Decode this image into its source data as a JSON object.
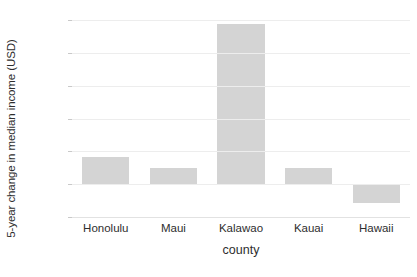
{
  "chart_data": {
    "type": "bar",
    "title": "",
    "subtitle": "",
    "xlabel": "county",
    "ylabel": "5-year change in median income (USD)",
    "categories": [
      "Honolulu",
      "Maui",
      "Kalawao",
      "Kauai",
      "Hawaii"
    ],
    "values": [
      4200,
      2400,
      24400,
      2500,
      -2900
    ],
    "ylim": [
      -5000,
      25000
    ],
    "ytick_values": [
      25000,
      20000,
      15000,
      10000,
      5000,
      0,
      -5000
    ],
    "ytick_labels": [
      "$25,000",
      "$20,000",
      "$15,000",
      "$10,000",
      "$5,000",
      "$0",
      "-$5,000"
    ],
    "grid": true,
    "legend": null,
    "legend_position": "none",
    "bar_color": "#d4d4d4",
    "gridline_color": "#ededed",
    "background_color": "#ffffff",
    "text_color": "#2e2e2e"
  }
}
